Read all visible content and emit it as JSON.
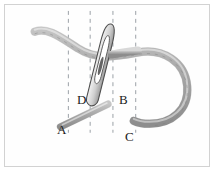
{
  "figure": {
    "background": "#fefefe",
    "border_color": "#d2d2d2",
    "thread_color": "#9a9a9a",
    "thread_fill": "#bdbdbd",
    "needle_color": "#6e6e6e",
    "guide_color": "#9aa0a6",
    "label_color": "#1a1a1a"
  },
  "labels": [
    {
      "id": "A",
      "text": "A",
      "x": 52,
      "y": 118
    },
    {
      "id": "B",
      "text": "B",
      "x": 114,
      "y": 88
    },
    {
      "id": "C",
      "text": "C",
      "x": 120,
      "y": 125
    },
    {
      "id": "D",
      "text": "D",
      "x": 72,
      "y": 88
    }
  ],
  "guide_lines": [
    {
      "id": "guide-1",
      "x": 68,
      "y1": 10,
      "y2": 133
    },
    {
      "id": "guide-2",
      "x": 90,
      "y1": 10,
      "y2": 133
    },
    {
      "id": "guide-3",
      "x": 113,
      "y1": 10,
      "y2": 133
    },
    {
      "id": "guide-4",
      "x": 136,
      "y1": 10,
      "y2": 133
    }
  ],
  "elements": {
    "main_thread": "long curved thread entering upper-left, sweeping right and looping clockwise down and back to a free end near C",
    "short_thread": "short straight thread stub running from A up-right toward B",
    "needle": "slender sewing needle tilted, eye slit visible, crossing the main thread"
  }
}
